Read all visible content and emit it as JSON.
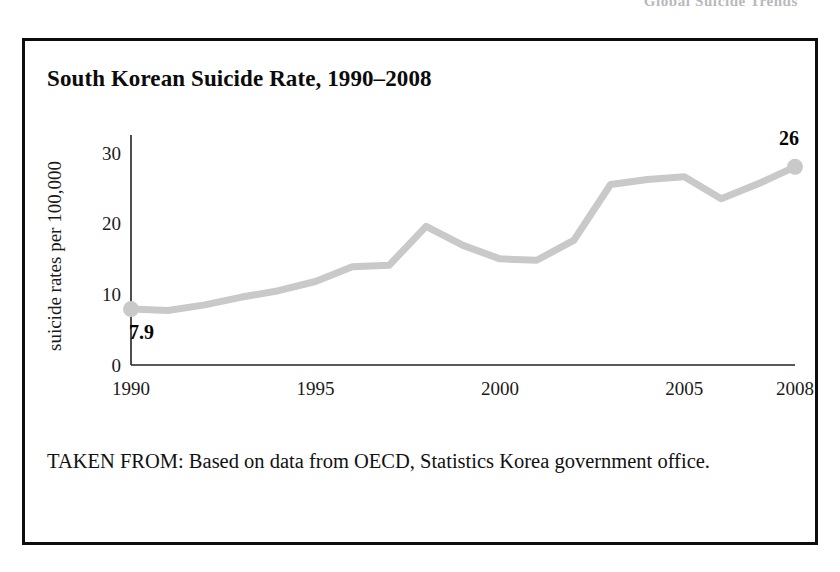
{
  "page": {
    "running_header": "Global Suicide Trends"
  },
  "figure": {
    "title": "South Korean Suicide Rate, 1990–2008",
    "source_note": "TAKEN FROM: Based on data from OECD, Statistics Korea government office."
  },
  "chart_data": {
    "type": "line",
    "title": "South Korean Suicide Rate, 1990–2008",
    "xlabel": "",
    "ylabel": "suicide rates per 100,000",
    "x": [
      1990,
      1991,
      1992,
      1993,
      1994,
      1995,
      1996,
      1997,
      1998,
      1999,
      2000,
      2001,
      2002,
      2003,
      2004,
      2005,
      2006,
      2007,
      2008
    ],
    "values": [
      7.9,
      7.7,
      8.5,
      9.6,
      10.5,
      11.8,
      13.9,
      14.1,
      19.6,
      16.9,
      15.0,
      14.8,
      17.6,
      25.5,
      26.2,
      26.6,
      23.5,
      25.6,
      28.0
    ],
    "xticks": [
      "1990",
      "1995",
      "2000",
      "2005",
      "2008"
    ],
    "xtick_values": [
      1990,
      1995,
      2000,
      2005,
      2008
    ],
    "yticks": [
      "0",
      "10",
      "20",
      "30"
    ],
    "ytick_values": [
      0,
      10,
      20,
      30
    ],
    "xlim": [
      1990,
      2008
    ],
    "ylim": [
      0,
      32.5
    ],
    "grid": false,
    "legend": "none",
    "line_color": "#c9c9c9",
    "axis_color": "#222222",
    "annotations": [
      {
        "name": "start-value-label",
        "text": "7.9",
        "x": 1990,
        "y": 7.9
      },
      {
        "name": "end-value-label",
        "text": "26",
        "x": 2008,
        "y": 28.0
      }
    ],
    "markers": [
      {
        "name": "start-marker",
        "x": 1990,
        "y": 7.9
      },
      {
        "name": "end-marker",
        "x": 2008,
        "y": 28.0
      }
    ]
  }
}
